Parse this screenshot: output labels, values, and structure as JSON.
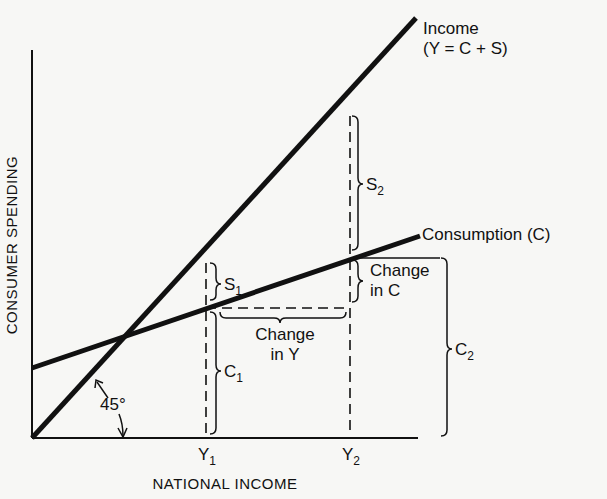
{
  "diagram": {
    "type": "keynesian-cross",
    "colors": {
      "background": "#f7f7f5",
      "ink": "#111111"
    },
    "axes": {
      "x_title": "NATIONAL INCOME",
      "y_title": "CONSUMER SPENDING",
      "x_ticks": [
        {
          "base": "Y",
          "sub": "1"
        },
        {
          "base": "Y",
          "sub": "2"
        }
      ]
    },
    "lines": {
      "income": {
        "label_line1": "Income",
        "label_line2": "(Y = C + S)"
      },
      "consumption": {
        "label": "Consumption (C)"
      }
    },
    "annotations": {
      "angle": "45°",
      "s1": {
        "base": "S",
        "sub": "1"
      },
      "s2": {
        "base": "S",
        "sub": "2"
      },
      "c1": {
        "base": "C",
        "sub": "1"
      },
      "c2": {
        "base": "C",
        "sub": "2"
      },
      "change_in_c": {
        "line1": "Change",
        "line2": "in C"
      },
      "change_in_y": {
        "line1": "Change",
        "line2": "in Y"
      }
    }
  }
}
